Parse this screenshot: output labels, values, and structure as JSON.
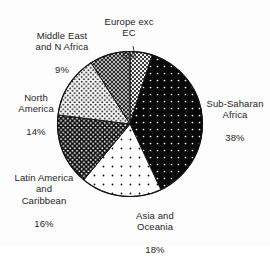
{
  "chart_data": {
    "type": "pie",
    "title": "",
    "subtitle": "",
    "xlabel": "",
    "ylabel": "",
    "legend_position": "none",
    "labels_position": "outside",
    "grid": false,
    "units": "percent",
    "categories": [
      "Sub-Saharan Africa",
      "Asia and Oceania",
      "Latin America and Caribbean",
      "North America",
      "Middle East and N Africa",
      "Europe exc EC"
    ],
    "values": [
      38,
      18,
      16,
      14,
      9,
      5
    ],
    "slices": [
      {
        "name": "Sub-Saharan Africa",
        "label_lines": "Sub-Saharan\nAfrica",
        "percent_text": "38%",
        "value": 38,
        "start_angle": 18,
        "end_angle": 154.8,
        "fill": "#080808",
        "dot": "#ffffff",
        "pattern": "black-fine-white-dots"
      },
      {
        "name": "Asia and Oceania",
        "label_lines": "Asia and\nOceania",
        "percent_text": "18%",
        "value": 18,
        "start_angle": 154.8,
        "end_angle": 219.6,
        "fill": "#ffffff",
        "dot": "#111111",
        "pattern": "white-sparse-black-dots"
      },
      {
        "name": "Latin America and Caribbean",
        "label_lines": "Latin America\nand\nCaribbean",
        "percent_text": "16%",
        "value": 16,
        "start_angle": 219.6,
        "end_angle": 277.2,
        "fill": "#0d0d0d",
        "dot": "#ffffff",
        "pattern": "black-dense-white-dot-grid"
      },
      {
        "name": "North America",
        "label_lines": "North\nAmerica",
        "percent_text": "14%",
        "value": 14,
        "start_angle": 277.2,
        "end_angle": 327.6,
        "fill": "#fbfbfb",
        "dot": "#1a1a1a",
        "pattern": "white-dense-black-dot-grid"
      },
      {
        "name": "Middle East and N Africa",
        "label_lines": "Middle East\nand N Africa",
        "percent_text": "9%",
        "value": 9,
        "start_angle": 327.6,
        "end_angle": 360,
        "fill": "#2a2a2a",
        "dot": "#e8e8e8",
        "pattern": "dark-crosshatch"
      },
      {
        "name": "Europe exc EC",
        "label_lines": "Europe exc\nEC",
        "percent_text": "5%",
        "value": 5,
        "start_angle": 0,
        "end_angle": 18,
        "fill": "#f2f2f2",
        "dot": "#333333",
        "pattern": "light-checker",
        "has_leader_line": true
      }
    ],
    "colors": {
      "outline": "#111111",
      "background": "#fdfdfd",
      "text": "#252525"
    }
  }
}
